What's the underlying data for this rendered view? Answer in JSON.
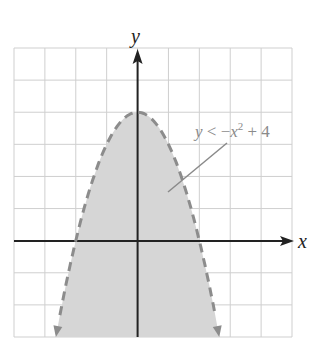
{
  "chart_data": {
    "type": "area",
    "title": "",
    "xlabel": "x",
    "ylabel": "y",
    "xlim": [
      -4,
      5
    ],
    "ylim": [
      -3,
      6
    ],
    "grid": true,
    "grid_step": 1,
    "tick_labels_shown": false,
    "series": [
      {
        "name": "y < -x^2 + 4",
        "equation": "y = -x^2 + 4",
        "boundary_style": "dashed",
        "shaded_region": "below curve",
        "vertex": [
          0,
          4
        ],
        "x_intercepts": [
          -2,
          2
        ],
        "points": [
          [
            -2.65,
            -3
          ],
          [
            -2,
            0
          ],
          [
            -1,
            3
          ],
          [
            0,
            4
          ],
          [
            1,
            3
          ],
          [
            2,
            0
          ],
          [
            2.65,
            -3
          ]
        ]
      }
    ],
    "annotations": [
      {
        "text": "y < −x² + 4",
        "points_to": "shaded region",
        "position": "upper right of vertex"
      }
    ],
    "colors": {
      "shade": "#d6d6d6",
      "boundary": "#8c8c8c",
      "grid": "#cfcfcf",
      "axes": "#222222",
      "label": "#8a8a8a"
    }
  },
  "labels": {
    "x_axis": "x",
    "y_axis": "y",
    "inequality_y": "y",
    "inequality_op": " < −",
    "inequality_x": "x",
    "inequality_exp": "2",
    "inequality_tail": " + 4"
  }
}
